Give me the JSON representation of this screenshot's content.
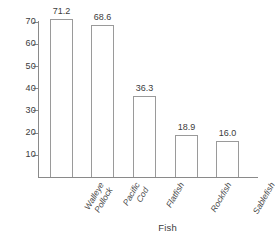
{
  "chart_data": {
    "type": "bar",
    "title": "",
    "xlabel": "Fish",
    "ylabel": "",
    "categories": [
      "Walleye Pollock",
      "Pacific Cod",
      "Flatfish",
      "Rockfish",
      "Sablefish"
    ],
    "category_lines": [
      [
        "Walleye",
        "Pollock"
      ],
      [
        "Pacific",
        "Cod"
      ],
      [
        "Flatfish"
      ],
      [
        "Rockfish"
      ],
      [
        "Sablefish"
      ]
    ],
    "values": [
      71.2,
      68.6,
      36.3,
      18.9,
      16.0
    ],
    "value_labels": [
      "71.2",
      "68.6",
      "36.3",
      "18.9",
      "16.0"
    ],
    "yticks": [
      70,
      60,
      50,
      40,
      30,
      20,
      10
    ],
    "ytick_labels": [
      "70",
      "60",
      "50",
      "40",
      "30",
      "20",
      "10"
    ],
    "ylim": [
      0,
      75
    ],
    "grid": false,
    "legend": false,
    "bar_fill_color": "#ffffff",
    "bar_edge_color": "#9a9a9a",
    "axis_color": "#8a8a8a",
    "text_color": "#3c3c3c"
  }
}
